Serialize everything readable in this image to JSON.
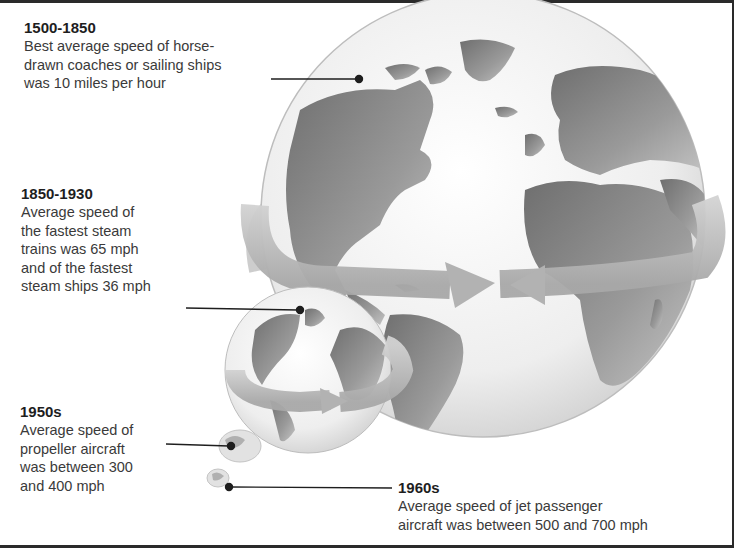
{
  "captions": [
    {
      "era": "1500-1850",
      "lines": [
        "Best average speed of horse-",
        "drawn coaches or sailing ships",
        "was 10 miles per hour"
      ],
      "speed_mph": "10",
      "mode": "horse-drawn coaches or sailing ships"
    },
    {
      "era": "1850-1930",
      "lines": [
        "Average speed of",
        "the fastest steam",
        "trains was 65 mph",
        "and of the fastest",
        "steam ships 36 mph"
      ],
      "speed_mph": "65 / 36",
      "mode": "steam trains / steam ships"
    },
    {
      "era": "1950s",
      "lines": [
        "Average speed of",
        "propeller aircraft",
        "was between 300",
        "and 400 mph"
      ],
      "speed_mph": "300-400",
      "mode": "propeller aircraft"
    },
    {
      "era": "1960s",
      "lines": [
        "Average speed of jet passenger",
        "aircraft was between 500 and 700 mph"
      ],
      "speed_mph": "500-700",
      "mode": "jet passenger aircraft"
    }
  ],
  "globes": [
    {
      "label": "large-globe",
      "era_ref": "1500-1850"
    },
    {
      "label": "medium-globe",
      "era_ref": "1850-1930"
    },
    {
      "label": "small-globe",
      "era_ref": "1950s"
    },
    {
      "label": "tiny-globe",
      "era_ref": "1960s"
    }
  ],
  "colors": {
    "frame": "#2a2a2a",
    "ocean": "#f2f2f2",
    "land": "#8a8a8a",
    "ring": "#bdbdbd",
    "leader": "#1e1e1e"
  }
}
